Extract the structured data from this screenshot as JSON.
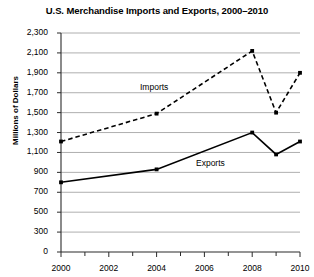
{
  "chart_data": {
    "type": "line",
    "title": "U.S. Merchandise Imports and Exports, 2000–2010",
    "xlabel": "",
    "ylabel": "Millions of Dollars",
    "grid": true,
    "legend_position": "inline-annotation",
    "xlim": [
      2000,
      2010
    ],
    "ylim": [
      0,
      2300
    ],
    "x_tick_labels": [
      "2000",
      "2002",
      "2004",
      "2006",
      "2008",
      "2010"
    ],
    "x_tick_values": [
      2000,
      2002,
      2004,
      2006,
      2008,
      2010
    ],
    "x_minor_ticks": [
      2001,
      2003,
      2005,
      2007,
      2009
    ],
    "y_tick_labels": [
      "0",
      "300",
      "500",
      "700",
      "900",
      "1,100",
      "1,300",
      "1,500",
      "1,700",
      "1,900",
      "2,100",
      "2,300"
    ],
    "y_tick_values": [
      0,
      300,
      500,
      700,
      900,
      1100,
      1300,
      1500,
      1700,
      1900,
      2100,
      2300
    ],
    "series": [
      {
        "name": "Imports",
        "style": "dashed",
        "marker": "square",
        "color": "#000000",
        "x": [
          2000,
          2004,
          2008,
          2009,
          2010
        ],
        "values": [
          1210,
          1490,
          2120,
          1500,
          1900
        ],
        "label_text": "Imports"
      },
      {
        "name": "Exports",
        "style": "solid",
        "marker": "square",
        "color": "#000000",
        "x": [
          2000,
          2004,
          2008,
          2009,
          2010
        ],
        "values": [
          800,
          930,
          1300,
          1080,
          1210
        ],
        "label_text": "Exports"
      }
    ]
  },
  "annotations": {
    "imports_label": "Imports",
    "exports_label": "Exports"
  }
}
